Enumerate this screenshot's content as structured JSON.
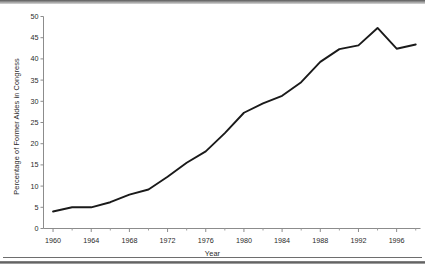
{
  "figure": {
    "background_color": "#ffffff",
    "line_color": "#1a1a1a",
    "axis_color": "#808080",
    "text_color": "#2a2a2a"
  },
  "chart_data": {
    "type": "line",
    "title": "",
    "subtitle": "",
    "xlabel": "Year",
    "ylabel": "Percentage of Former Aides in Congress",
    "xlim": [
      1959,
      1998.5
    ],
    "ylim": [
      0,
      50
    ],
    "grid": false,
    "legend": false,
    "legend_position": "none",
    "x_tick_labels": [
      "1960",
      "1964",
      "1968",
      "1972",
      "1976",
      "1980",
      "1984",
      "1988",
      "1992",
      "1996"
    ],
    "x_tick_values": [
      1960,
      1964,
      1968,
      1972,
      1976,
      1980,
      1984,
      1988,
      1992,
      1996
    ],
    "x_minor_tick_values": [
      1962,
      1966,
      1970,
      1974,
      1978,
      1982,
      1986,
      1990,
      1994,
      1998
    ],
    "y_tick_labels": [
      "0",
      "5",
      "10",
      "15",
      "20",
      "25",
      "30",
      "35",
      "40",
      "45",
      "50"
    ],
    "y_tick_values": [
      0,
      5,
      10,
      15,
      20,
      25,
      30,
      35,
      40,
      45,
      50
    ],
    "series": [
      {
        "name": "Percentage of Former Aides in Congress",
        "x": [
          1960,
          1962,
          1964,
          1966,
          1968,
          1970,
          1972,
          1974,
          1976,
          1978,
          1980,
          1982,
          1984,
          1986,
          1988,
          1990,
          1992,
          1994,
          1996,
          1998
        ],
        "values": [
          4.0,
          5.0,
          5.0,
          6.2,
          8.0,
          9.2,
          12.2,
          15.5,
          18.2,
          22.5,
          27.3,
          29.5,
          31.3,
          34.5,
          39.3,
          42.3,
          43.2,
          47.3,
          42.4,
          43.4
        ]
      }
    ]
  }
}
